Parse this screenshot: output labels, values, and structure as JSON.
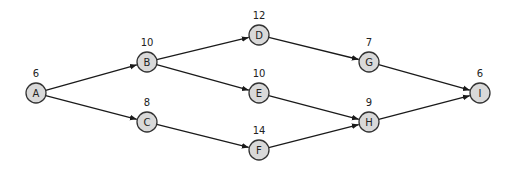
{
  "diagram": {
    "type": "directed-network",
    "node_radius": 10,
    "colors": {
      "node_fill": "#d9d9d9",
      "node_stroke": "#333333",
      "edge": "#1a1a1a",
      "text": "#222222"
    },
    "nodes": [
      {
        "id": "A",
        "label": "A",
        "weight": "6",
        "x": 36,
        "y": 93
      },
      {
        "id": "B",
        "label": "B",
        "weight": "10",
        "x": 147,
        "y": 62
      },
      {
        "id": "C",
        "label": "C",
        "weight": "8",
        "x": 147,
        "y": 122
      },
      {
        "id": "D",
        "label": "D",
        "weight": "12",
        "x": 259,
        "y": 35
      },
      {
        "id": "E",
        "label": "E",
        "weight": "10",
        "x": 259,
        "y": 93
      },
      {
        "id": "F",
        "label": "F",
        "weight": "14",
        "x": 259,
        "y": 150
      },
      {
        "id": "G",
        "label": "G",
        "weight": "7",
        "x": 369,
        "y": 62
      },
      {
        "id": "H",
        "label": "H",
        "weight": "9",
        "x": 369,
        "y": 122
      },
      {
        "id": "I",
        "label": "I",
        "weight": "6",
        "x": 480,
        "y": 93
      }
    ],
    "edges": [
      {
        "from": "A",
        "to": "B"
      },
      {
        "from": "A",
        "to": "C"
      },
      {
        "from": "B",
        "to": "D"
      },
      {
        "from": "B",
        "to": "E"
      },
      {
        "from": "C",
        "to": "F"
      },
      {
        "from": "D",
        "to": "G"
      },
      {
        "from": "E",
        "to": "H"
      },
      {
        "from": "F",
        "to": "H"
      },
      {
        "from": "G",
        "to": "I"
      },
      {
        "from": "H",
        "to": "I"
      }
    ]
  }
}
